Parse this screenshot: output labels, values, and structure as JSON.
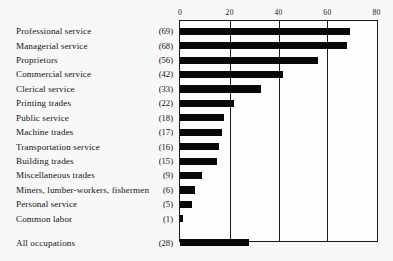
{
  "chart_data": {
    "type": "bar",
    "orientation": "horizontal",
    "title": "",
    "xlabel": "",
    "ylabel": "",
    "xlim": [
      0,
      80
    ],
    "ticks": [
      "0",
      "20",
      "40",
      "60",
      "80"
    ],
    "tick_values": [
      0,
      20,
      40,
      60,
      80
    ],
    "grid": true,
    "legend": "none",
    "categories": [
      "Professional service",
      "Managerial service",
      "Proprietors",
      "Commercial service",
      "Clerical service",
      "Printing trades",
      "Public service",
      "Machine trades",
      "Transportation service",
      "Building trades",
      "Miscellaneous trades",
      "Miners, lumber-workers, fishermen",
      "Personal service",
      "Common labor",
      "All occupations"
    ],
    "values": [
      69,
      68,
      56,
      42,
      33,
      22,
      18,
      17,
      16,
      15,
      9,
      6,
      5,
      1,
      28
    ],
    "value_labels": [
      "(69)",
      "(68)",
      "(56)",
      "(42)",
      "(33)",
      "(22)",
      "(18)",
      "(17)",
      "(16)",
      "(15)",
      "(9)",
      "(6)",
      "(5)",
      "(1)",
      "(28)"
    ],
    "summary_row_index": 14,
    "bar_color": "#080808",
    "frame_color": "#1a1a1a",
    "background_color": "#f8f8f8"
  }
}
